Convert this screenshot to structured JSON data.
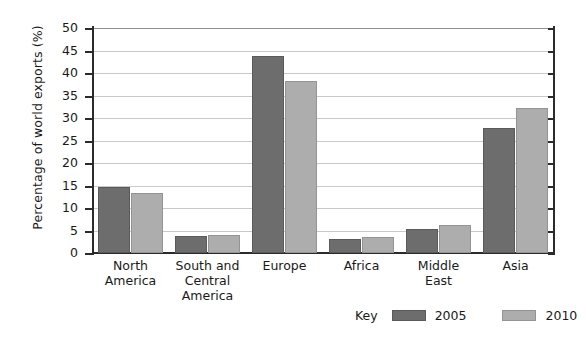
{
  "chart_data": {
    "type": "bar",
    "title": "",
    "xlabel": "",
    "ylabel": "Percentage of world exports (%)",
    "ylim": [
      0,
      50
    ],
    "ytick_step": 5,
    "yticks": [
      0,
      5,
      10,
      15,
      20,
      25,
      30,
      35,
      40,
      45,
      50
    ],
    "grid": true,
    "legend_position": "bottom-right",
    "legend_title": "Key",
    "categories": [
      "North America",
      "South and Central America",
      "Europe",
      "Africa",
      "Middle East",
      "Asia"
    ],
    "category_label_lines": [
      [
        "North",
        "America"
      ],
      [
        "South and",
        "Central",
        "America"
      ],
      [
        "Europe"
      ],
      [
        "Africa"
      ],
      [
        "Middle",
        "East"
      ],
      [
        "Asia"
      ]
    ],
    "series": [
      {
        "name": "2005",
        "color": "#6d6d6d",
        "values": [
          14.7,
          3.8,
          43.7,
          3.2,
          5.4,
          27.8
        ]
      },
      {
        "name": "2010",
        "color": "#adadad",
        "values": [
          13.4,
          3.9,
          38.3,
          3.5,
          6.2,
          32.2
        ]
      }
    ]
  },
  "colors": {
    "series_2005": "#6d6d6d",
    "series_2010": "#adadad",
    "gridline": "#c9c9c9",
    "axis": "#2b2b2b",
    "text": "#1a1a1a",
    "background": "#ffffff"
  }
}
